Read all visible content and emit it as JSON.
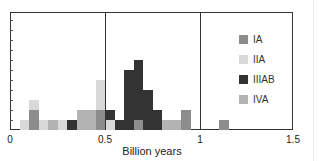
{
  "chart_data": {
    "type": "bar",
    "stacked": true,
    "title": "",
    "xlabel": "Billion years",
    "ylabel": "",
    "xlim": [
      0,
      1.5
    ],
    "ylim": [
      0,
      11.8
    ],
    "x_ticks": [
      "0",
      "0.5",
      "1",
      "1.5"
    ],
    "y_ticks_count": 11,
    "bin_width": 0.05,
    "bins": [
      0.05,
      0.1,
      0.15,
      0.2,
      0.25,
      0.3,
      0.35,
      0.4,
      0.45,
      0.5,
      0.55,
      0.6,
      0.65,
      0.7,
      0.75,
      0.8,
      0.85,
      0.9,
      1.1
    ],
    "series": [
      {
        "name": "IA",
        "color": "#8c8c8c",
        "values": [
          0,
          2,
          0,
          0,
          0,
          0,
          0,
          0,
          2,
          0,
          0,
          0,
          1,
          0,
          0,
          0,
          0,
          2,
          1
        ]
      },
      {
        "name": "IIA",
        "color": "#d9d9d9",
        "values": [
          1,
          1,
          1,
          0,
          1,
          0,
          0,
          0,
          3,
          1,
          0,
          0,
          0,
          0,
          0,
          0,
          0,
          0,
          0
        ]
      },
      {
        "name": "IIIAB",
        "color": "#333333",
        "values": [
          0,
          0,
          0,
          0,
          0,
          1,
          0,
          0,
          0,
          1,
          1,
          6,
          6,
          4,
          2,
          0,
          0,
          0,
          0
        ]
      },
      {
        "name": "IVA",
        "color": "#b3b3b3",
        "values": [
          0,
          0,
          0,
          1,
          0,
          0,
          2,
          2,
          0,
          0,
          0,
          0,
          0,
          0,
          0,
          1,
          1,
          0,
          0
        ]
      }
    ],
    "stack_order_bottom_to_top": {
      "0.45": [
        "IA",
        "IIA"
      ],
      "0.50": [
        "IIA",
        "IIIAB"
      ],
      "0.65": [
        "IA",
        "IIIAB"
      ],
      "0.10": [
        "IA",
        "IIA"
      ]
    },
    "vertical_gridlines": [
      0.5,
      1.0
    ],
    "grid": false,
    "legend_position": "upper right"
  },
  "legend": [
    {
      "label": "IA",
      "color": "#8c8c8c"
    },
    {
      "label": "IIA",
      "color": "#d9d9d9"
    },
    {
      "label": "IIIAB",
      "color": "#333333"
    },
    {
      "label": "IVA",
      "color": "#b3b3b3"
    }
  ],
  "axis": {
    "xlabel": "Billion years",
    "ticks": [
      {
        "label": "0",
        "value": 0
      },
      {
        "label": "0.5",
        "value": 0.5
      },
      {
        "label": "1",
        "value": 1
      },
      {
        "label": "1.5",
        "value": 1.5
      }
    ]
  }
}
